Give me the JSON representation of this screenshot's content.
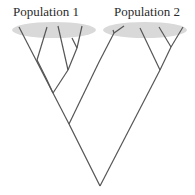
{
  "populations": [
    {
      "label": "Population 1",
      "ellipse_color": "#d9d9d9"
    },
    {
      "label": "Population 2",
      "ellipse_color": "#d9d9d9"
    }
  ],
  "tree": {
    "line_color": "#555555",
    "type": "phylogenetic-gene-tree"
  }
}
